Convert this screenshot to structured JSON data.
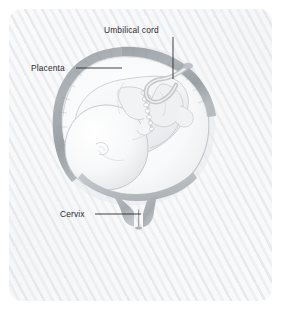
{
  "figure": {
    "name": "fetus-in-uterus-anatomical-illustration",
    "panel": {
      "background_color": "#f4f5f7",
      "corner_radius_px": 13,
      "texture": "diagonal-stripe-paper"
    }
  },
  "labels": [
    {
      "id": "umbilical-cord",
      "text": "Umbilical cord",
      "text_position": {
        "x": 104,
        "y": 26
      },
      "leader": {
        "type": "vertical",
        "x": 173,
        "y_start": 37,
        "y_end": 79
      }
    },
    {
      "id": "placenta",
      "text": "Placenta",
      "text_position": {
        "x": 31,
        "y": 64
      },
      "leader": {
        "type": "horizontal",
        "y": 68,
        "x_start": 76,
        "x_end": 122
      }
    },
    {
      "id": "cervix",
      "text": "Cervix",
      "text_position": {
        "x": 60,
        "y": 210
      },
      "leader": {
        "type": "horizontal",
        "y": 214,
        "x_start": 95,
        "x_end": 141
      }
    }
  ],
  "anatomy": {
    "uterus": {
      "name": "uterine-wall",
      "outline_color": "#b9bec2",
      "fill_color": "#fafbfc"
    },
    "placenta": {
      "name": "placenta-band",
      "band_color": "#a7acb0",
      "location": "upper and left uterine wall"
    },
    "fetus": {
      "name": "fetus",
      "presentation": "cephalic (head down)",
      "fill_color": "#f6f7f8",
      "outline_color": "#c6cacd",
      "parts": [
        "head",
        "torso",
        "spine",
        "limbs",
        "ear"
      ]
    },
    "umbilical_cord": {
      "name": "umbilical-cord",
      "color": "#c9cdd0"
    },
    "cervix": {
      "name": "cervix",
      "color": "#b4b9bd",
      "state": "closed"
    },
    "colors": {
      "line_dark": "#2b2b2d",
      "gray_mid": "#a7acb0",
      "gray_light": "#c9cdd0",
      "gray_pale": "#e2e5e8"
    }
  }
}
